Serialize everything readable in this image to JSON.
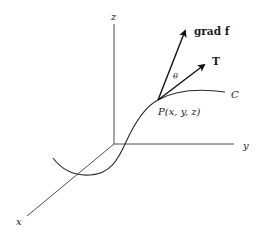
{
  "diagram": {
    "axes": {
      "x_label": "x",
      "y_label": "y",
      "z_label": "z"
    },
    "curve": {
      "label": "C"
    },
    "point": {
      "label": "P(x, y, z)"
    },
    "vectors": {
      "gradient_label": "grad f",
      "tangent_label": "T",
      "angle_label": "θ"
    },
    "colors": {
      "ink": "#1a1a1a",
      "background": "#ffffff"
    }
  }
}
